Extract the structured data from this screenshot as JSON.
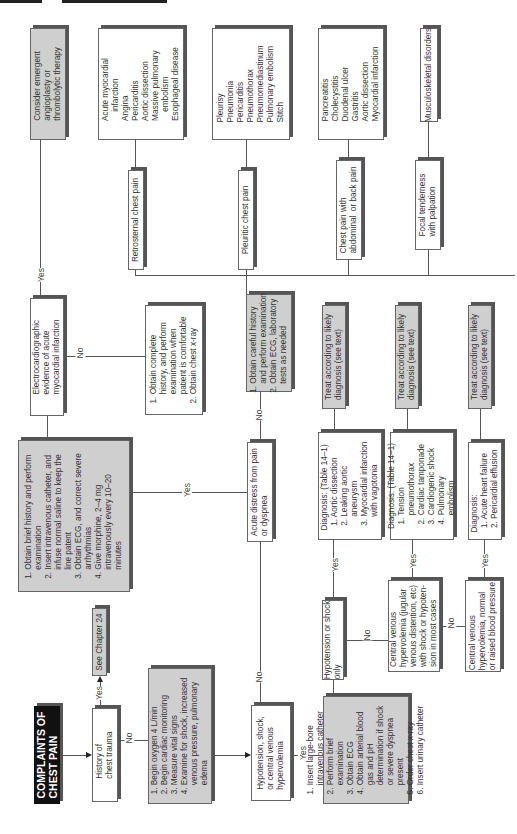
{
  "title": "COMPLAINTS OF\nCHEST PAIN",
  "chapter_ref": "See Chapter 24",
  "nodes": {
    "history_trauma": "History of\nchest trauma",
    "initial_steps": "1. Begin oxygen 4 L/min\n2. Begin cardiac monitoring\n3. Measure vital signs\n4. Examine for shock, increased\n    venous pressure, pulmonary\n    edema",
    "hypotension_q": "Hypotension, shock,\nor central venous\nhypervolemia",
    "shock_steps": "1. Insert large-bore\n    intravenous catheter\n2. Perform brief\n    examination\n3. Obtain ECG\n4. Obtain arterial blood\n    gas and pH\n    determination if shock\n    or severe dyspnea\n    present\n5. Order chest x-ray\n6. Insert urinary catheter",
    "hypo_only": "Hypotension or shock\nonly",
    "cv_hyper_shock": "Central venous\nhypervolemia (jugular\nvenous distention, etc)\nwith shock or hypoten-\nsion in most cases",
    "cv_hyper_normal": "Central venous\nhypervolemia, normal\nor raised blood pressure",
    "diag1": "Diagnosis: (Table 14–1)\n  1. Aortic dissection\n  2. Leaking aortic\n      aneurysm\n  3. Myocardial infarction\n      with vagotonia",
    "diag2": "Diagnosis: (Table 14–1)\n  1. Tension\n      pneumothorax\n  2. Cardiac tamponade\n  3. Cardiogenic shock\n  4. Pulmonary\n      embolism",
    "diag3": "Diagnosis:\n  1. Acute heart failure\n  2. Pericardial effusion",
    "treat1": "Treat according to likely\ndiagnosis (see text)",
    "treat2": "Treat according to likely\ndiagnosis (see text)",
    "treat3": "Treat according to likely\ndiagnosis (see text)",
    "acute_distress_q": "Acute distress from pain\nor dyspnea",
    "distress_steps": "1. Obtain brief history and perform\n    examination\n2. Insert intravenous catheter, and\n    infuse normal saline to keep the\n    line patent\n3. Obtain ECG, and correct severe\n    arrhythmias\n4. Give morphine, 2–4 mg\n    intravenously every 10–20\n    minutes",
    "ecg_q": "Electrocardiographic\nevidence of acute\nmyocardial infarction",
    "complete_history": "1. Obtain complete\n    history, and perform\n    examination when\n    patient is comfortable\n2. Obtain chest x-ray",
    "emergent": "Consider emergent\nangioplasty or\nthrombolytic therapy",
    "careful_history": "1. Obtain careful history\n    and perform examination\n2. Obtain ECG, laboratory\n    tests as needed",
    "retrosternal": "Retrosternal chest pain",
    "pleuritic": "Pleuritic chest pain",
    "abdominal": "Chest pain with\nabdominal  or back pain",
    "focal": "Focal tenderness\nwith palpation",
    "retro_dx": "Acute myocardial\n    infarction\nAngina\nPericarditis\nAortic dissection\nMassive pulmonary\n    embolism\nEsophageal disease",
    "pleur_dx": "Pleurisy\nPneumonia\nPericarditis\nPneumothorax\nPneumomediastinum\nPulmonary embolism\nStitch",
    "abd_dx": "Pancreatitis\nCholecystitis\nDuodenal ulcer\nGastritis\nAortic dissection\nMyocardial infarction",
    "focal_dx": "Musculoskeletal disorders"
  },
  "labels": {
    "yes": "Yes",
    "no": "No"
  }
}
